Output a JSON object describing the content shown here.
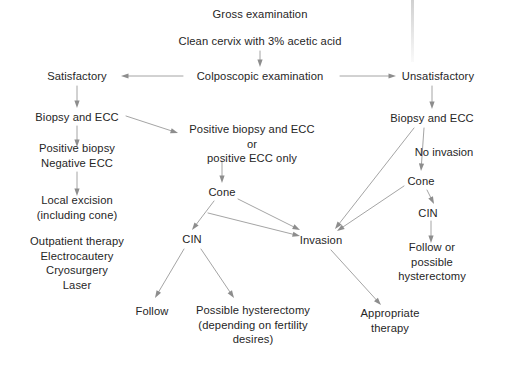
{
  "figure": {
    "domain": "diagram",
    "type": "clinical-flowchart",
    "width": 517,
    "height": 367,
    "background_color": "#ffffff",
    "text_color": "#262626",
    "edge_color": "#9a9a9a"
  },
  "nodes": [
    {
      "id": "gross-examination",
      "label": "Gross examination",
      "x": 260,
      "y": 14
    },
    {
      "id": "clean-cervix",
      "label": "Clean cervix with 3% acetic acid",
      "x": 260,
      "y": 41
    },
    {
      "id": "colposcopic-examination",
      "label": "Colposcopic examination",
      "x": 260,
      "y": 76
    },
    {
      "id": "satisfactory",
      "label": "Satisfactory",
      "x": 77,
      "y": 76
    },
    {
      "id": "unsatisfactory",
      "label": "Unsatisfactory",
      "x": 438,
      "y": 76
    },
    {
      "id": "biopsy-ecc-left",
      "label": "Biopsy and ECC",
      "x": 77,
      "y": 117
    },
    {
      "id": "positive-negative-ecc",
      "label": "Positive biopsy\nNegative ECC",
      "x": 77,
      "y": 156
    },
    {
      "id": "local-excision",
      "label": "Local excision\n(including cone)",
      "x": 77,
      "y": 208
    },
    {
      "id": "outpatient-therapy",
      "label": "Outpatient therapy\nElectrocautery\nCryosurgery\nLaser",
      "x": 77,
      "y": 263
    },
    {
      "id": "positive-biopsy-ecc",
      "label": "Positive biopsy and ECC\nor\npositive ECC only",
      "x": 252,
      "y": 144
    },
    {
      "id": "cone-middle",
      "label": "Cone",
      "x": 222,
      "y": 192
    },
    {
      "id": "cin-middle",
      "label": "CIN",
      "x": 192,
      "y": 239
    },
    {
      "id": "follow",
      "label": "Follow",
      "x": 152,
      "y": 311
    },
    {
      "id": "possible-hysterectomy",
      "label": "Possible hysterectomy\n(depending on fertility\ndesires)",
      "x": 253,
      "y": 325
    },
    {
      "id": "biopsy-ecc-right",
      "label": "Biopsy and ECC",
      "x": 432,
      "y": 118
    },
    {
      "id": "cone-right",
      "label": "Cone",
      "x": 421,
      "y": 181
    },
    {
      "id": "cin-right",
      "label": "CIN",
      "x": 428,
      "y": 213
    },
    {
      "id": "follow-or-hysterectomy",
      "label": "Follow or\npossible\nhysterectomy",
      "x": 432,
      "y": 262
    },
    {
      "id": "invasion",
      "label": "Invasion",
      "x": 321,
      "y": 240
    },
    {
      "id": "appropriate-therapy",
      "label": "Appropriate\ntherapy",
      "x": 390,
      "y": 321
    }
  ],
  "edge_labels": [
    {
      "id": "no-invasion",
      "label": "No invasion",
      "x": 444,
      "y": 152
    }
  ],
  "edges": [
    {
      "id": "clean-to-colposcopic",
      "from": "clean-cervix",
      "to": "colposcopic-examination",
      "x1": 260,
      "y1": 51,
      "x2": 260,
      "y2": 67
    },
    {
      "id": "colposcopic-to-satisfactory",
      "from": "colposcopic-examination",
      "to": "satisfactory",
      "x1": 183,
      "y1": 76,
      "x2": 121,
      "y2": 76
    },
    {
      "id": "colposcopic-to-unsatisfactory",
      "from": "colposcopic-examination",
      "to": "unsatisfactory",
      "x1": 340,
      "y1": 76,
      "x2": 396,
      "y2": 76
    },
    {
      "id": "satisfactory-to-biopsy",
      "from": "satisfactory",
      "to": "biopsy-ecc-left",
      "x1": 77,
      "y1": 86,
      "x2": 77,
      "y2": 108
    },
    {
      "id": "unsatisfactory-to-biopsy",
      "from": "unsatisfactory",
      "to": "biopsy-ecc-right",
      "x1": 432,
      "y1": 86,
      "x2": 432,
      "y2": 109
    },
    {
      "id": "biopsyleft-to-positive",
      "from": "biopsy-ecc-left",
      "to": "positive-negative-ecc",
      "x1": 77,
      "y1": 126,
      "x2": 77,
      "y2": 147
    },
    {
      "id": "biopsyleft-to-positiveecc",
      "from": "biopsy-ecc-left",
      "to": "positive-biopsy-ecc",
      "x1": 126,
      "y1": 116,
      "x2": 178,
      "y2": 133
    },
    {
      "id": "positive-to-excision",
      "from": "positive-negative-ecc",
      "to": "local-excision",
      "x1": 77,
      "y1": 172,
      "x2": 77,
      "y2": 196
    },
    {
      "id": "positiveecc-to-cone",
      "from": "positive-biopsy-ecc",
      "to": "cone-middle",
      "x1": 222,
      "y1": 161,
      "x2": 222,
      "y2": 183
    },
    {
      "id": "cone-to-cin",
      "from": "cone-middle",
      "to": "cin-middle",
      "x1": 214,
      "y1": 201,
      "x2": 192,
      "y2": 230
    },
    {
      "id": "cone-to-invasion",
      "from": "cone-middle",
      "to": "invasion",
      "x1": 238,
      "y1": 199,
      "x2": 300,
      "y2": 230
    },
    {
      "id": "cin-to-follow",
      "from": "cin-middle",
      "to": "follow",
      "x1": 184,
      "y1": 249,
      "x2": 155,
      "y2": 298
    },
    {
      "id": "cin-to-hysterectomy",
      "from": "cin-middle",
      "to": "possible-hysterectomy",
      "x1": 201,
      "y1": 249,
      "x2": 234,
      "y2": 298
    },
    {
      "id": "excision-area-to-invasion",
      "from": "local-excision",
      "to": "invasion",
      "x1": 208,
      "y1": 213,
      "x2": 300,
      "y2": 236
    },
    {
      "id": "biopsyright-to-noinvasion",
      "from": "biopsy-ecc-right",
      "to": "cone-right",
      "x1": 424,
      "y1": 128,
      "x2": 421,
      "y2": 171
    },
    {
      "id": "biopsyright-to-invasion",
      "from": "biopsy-ecc-right",
      "to": "invasion",
      "x1": 414,
      "y1": 128,
      "x2": 335,
      "y2": 229
    },
    {
      "id": "coneright-to-cin",
      "from": "cone-right",
      "to": "cin-right",
      "x1": 427,
      "y1": 190,
      "x2": 434,
      "y2": 204
    },
    {
      "id": "coneright-to-invasion",
      "from": "cone-right",
      "to": "invasion",
      "x1": 404,
      "y1": 186,
      "x2": 337,
      "y2": 231
    },
    {
      "id": "cinright-to-follow",
      "from": "cin-right",
      "to": "follow-or-hysterectomy",
      "x1": 431,
      "y1": 221,
      "x2": 431,
      "y2": 243
    },
    {
      "id": "invasion-to-therapy",
      "from": "invasion",
      "to": "appropriate-therapy",
      "x1": 331,
      "y1": 250,
      "x2": 381,
      "y2": 305
    }
  ],
  "artifacts": [
    {
      "id": "scan-streak-top",
      "x": 411,
      "y": 0,
      "height": 62
    }
  ]
}
